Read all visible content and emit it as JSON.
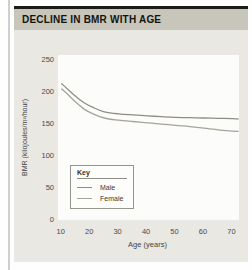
{
  "figure": {
    "title": "DECLINE IN BMR WITH AGE"
  },
  "colors": {
    "figure_background": "#e9e8e2",
    "title_bar_background": "#c8c5bb",
    "male_line": "#8e8d86",
    "female_line": "#a8a29a"
  },
  "chart_data": {
    "type": "line",
    "title": "DECLINE IN BMR WITH AGE",
    "xlabel": "Age (years)",
    "ylabel": "BMR (kilojoules/m²/hour)",
    "xlim": [
      8.7,
      72.3
    ],
    "ylim": [
      0,
      258
    ],
    "x_ticks": [
      10,
      20,
      30,
      40,
      50,
      60,
      70
    ],
    "y_ticks": [
      250,
      200,
      150,
      100,
      50,
      0
    ],
    "grid": false,
    "legend": {
      "title": "Key",
      "position": "lower-left"
    },
    "x": [
      10,
      12,
      15,
      18,
      21,
      25,
      30,
      35,
      40,
      45,
      50,
      55,
      60,
      65,
      70,
      72
    ],
    "series": [
      {
        "name": "Male",
        "color": "#8e8d86",
        "values": [
          213,
          205,
          193,
          183,
          176,
          169,
          166,
          164.5,
          163,
          161.5,
          160.5,
          160,
          159.5,
          159,
          158.5,
          158
        ]
      },
      {
        "name": "Female",
        "color": "#a8a29a",
        "values": [
          205,
          197,
          184,
          173,
          166,
          159.5,
          156,
          154,
          152,
          150,
          148,
          146,
          143.5,
          141,
          139,
          138.5
        ]
      }
    ]
  }
}
